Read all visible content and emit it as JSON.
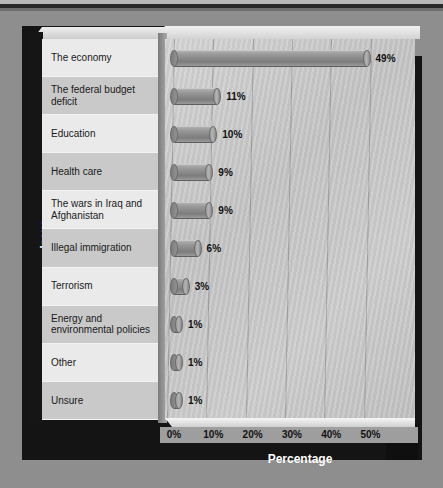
{
  "chart_data": {
    "type": "bar",
    "orientation": "horizontal",
    "title": "",
    "xlabel": "Percentage",
    "ylabel": "Issue",
    "categories": [
      "The economy",
      "The federal budget deficit",
      "Education",
      "Health care",
      "The wars in Iraq and Afghanistan",
      "Illegal immigration",
      "Terrorism",
      "Energy and environmental policies",
      "Other",
      "Unsure"
    ],
    "values": [
      49,
      11,
      10,
      9,
      9,
      6,
      3,
      1,
      1,
      1
    ],
    "value_labels": [
      "49%",
      "11%",
      "10%",
      "9%",
      "9%",
      "6%",
      "3%",
      "1%",
      "1%",
      "1%"
    ],
    "xlim": [
      0,
      55
    ],
    "xticks": [
      0,
      10,
      20,
      30,
      40,
      50
    ],
    "xtick_labels": [
      "0%",
      "10%",
      "20%",
      "30%",
      "40%",
      "50%"
    ],
    "grid": true,
    "legend": "none",
    "style": "3d-cylinder",
    "colors": {
      "bar": "#8c8c8c",
      "plot_background": "#cbcbcb",
      "frame": "#141414",
      "page_background": "#8e8e8e",
      "label_row_light": "#eaeaea",
      "label_row_dark": "#c9c9c9",
      "text": "#1a1a1a",
      "axis_title_text": "#ffffff"
    }
  }
}
